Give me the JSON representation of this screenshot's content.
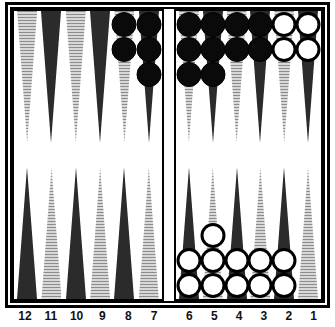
{
  "game": {
    "name": "Backgammon Board",
    "colors": {
      "checker_dark": "#0a0a0a",
      "checker_light": "#ffffff",
      "point_dark": "#2b2b2b",
      "point_light": "#d8d8d8",
      "frame": "#000000",
      "board_background": "#ffffff"
    }
  },
  "board": {
    "quadrants": {
      "top_left": {
        "name": "top-left-quadrant",
        "points": [
          {
            "label": "12",
            "shade": "light",
            "checkers": 0,
            "color": ""
          },
          {
            "label": "11",
            "shade": "dark",
            "checkers": 0,
            "color": ""
          },
          {
            "label": "10",
            "shade": "light",
            "checkers": 0,
            "color": ""
          },
          {
            "label": "9",
            "shade": "dark",
            "checkers": 0,
            "color": ""
          },
          {
            "label": "8",
            "shade": "light",
            "checkers": 2,
            "color": "black"
          },
          {
            "label": "7",
            "shade": "dark",
            "checkers": 3,
            "color": "black"
          }
        ]
      },
      "top_right": {
        "name": "top-right-quadrant",
        "points": [
          {
            "label": "6",
            "shade": "light",
            "checkers": 3,
            "color": "black"
          },
          {
            "label": "5",
            "shade": "dark",
            "checkers": 3,
            "color": "black"
          },
          {
            "label": "4",
            "shade": "light",
            "checkers": 2,
            "color": "black"
          },
          {
            "label": "3",
            "shade": "dark",
            "checkers": 2,
            "color": "black"
          },
          {
            "label": "2",
            "shade": "light",
            "checkers": 2,
            "color": "white"
          },
          {
            "label": "1",
            "shade": "dark",
            "checkers": 2,
            "color": "white"
          }
        ]
      },
      "bottom_left": {
        "name": "bottom-left-quadrant",
        "points": [
          {
            "label": "13",
            "shade": "dark",
            "checkers": 0,
            "color": ""
          },
          {
            "label": "14",
            "shade": "light",
            "checkers": 0,
            "color": ""
          },
          {
            "label": "15",
            "shade": "dark",
            "checkers": 0,
            "color": ""
          },
          {
            "label": "16",
            "shade": "light",
            "checkers": 0,
            "color": ""
          },
          {
            "label": "17",
            "shade": "dark",
            "checkers": 0,
            "color": ""
          },
          {
            "label": "18",
            "shade": "light",
            "checkers": 0,
            "color": ""
          }
        ]
      },
      "bottom_right": {
        "name": "bottom-right-quadrant",
        "points": [
          {
            "label": "19",
            "shade": "dark",
            "checkers": 2,
            "color": "white"
          },
          {
            "label": "20",
            "shade": "light",
            "checkers": 3,
            "color": "white"
          },
          {
            "label": "21",
            "shade": "dark",
            "checkers": 2,
            "color": "white"
          },
          {
            "label": "22",
            "shade": "light",
            "checkers": 2,
            "color": "white"
          },
          {
            "label": "23",
            "shade": "dark",
            "checkers": 2,
            "color": "white"
          },
          {
            "label": "24",
            "shade": "light",
            "checkers": 0,
            "color": ""
          }
        ]
      }
    }
  },
  "labels": {
    "left": [
      "12",
      "11",
      "10",
      "9",
      "8",
      "7"
    ],
    "right": [
      "6",
      "5",
      "4",
      "3",
      "2",
      "1"
    ]
  }
}
